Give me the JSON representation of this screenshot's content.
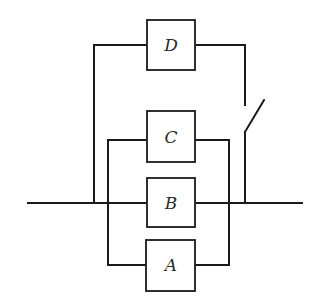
{
  "diagram": {
    "type": "circuit-reliability-network",
    "components": [
      {
        "id": "D",
        "label": "D"
      },
      {
        "id": "C",
        "label": "C"
      },
      {
        "id": "B",
        "label": "B"
      },
      {
        "id": "A",
        "label": "A"
      }
    ],
    "switch": {
      "label": "",
      "state": "open"
    },
    "colors": {
      "line": "#1a1a1a",
      "background": "#ffffff"
    }
  }
}
